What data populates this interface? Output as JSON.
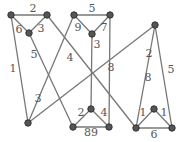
{
  "graph": {
    "nodes": [
      {
        "id": "A",
        "x": 11,
        "y": 15
      },
      {
        "id": "B",
        "x": 47,
        "y": 15
      },
      {
        "id": "C",
        "x": 29,
        "y": 33
      },
      {
        "id": "D",
        "x": 74,
        "y": 15
      },
      {
        "id": "E",
        "x": 110,
        "y": 15
      },
      {
        "id": "F",
        "x": 92,
        "y": 34
      },
      {
        "id": "G",
        "x": 155,
        "y": 25
      },
      {
        "id": "H",
        "x": 28,
        "y": 123
      },
      {
        "id": "I",
        "x": 73,
        "y": 127
      },
      {
        "id": "J",
        "x": 91,
        "y": 109
      },
      {
        "id": "K",
        "x": 109,
        "y": 127
      },
      {
        "id": "L",
        "x": 136,
        "y": 128
      },
      {
        "id": "M",
        "x": 154,
        "y": 109
      },
      {
        "id": "N",
        "x": 172,
        "y": 128
      }
    ],
    "edges": [
      {
        "from": "A",
        "to": "B",
        "label": "2",
        "lx": 33,
        "ly": 12
      },
      {
        "from": "A",
        "to": "C",
        "label": "6",
        "lx": 19,
        "ly": 33
      },
      {
        "from": "B",
        "to": "C",
        "label": "3",
        "lx": 41,
        "ly": 32
      },
      {
        "from": "A",
        "to": "H",
        "label": "1",
        "lx": 13,
        "ly": 72
      },
      {
        "from": "C",
        "to": "I",
        "label": "5",
        "lx": 34,
        "ly": 58
      },
      {
        "from": "D",
        "to": "H",
        "label": "3",
        "lx": 38,
        "ly": 102
      },
      {
        "from": "B",
        "to": "L",
        "label": "4",
        "lx": 70,
        "ly": 61
      },
      {
        "from": "D",
        "to": "E",
        "label": "5",
        "lx": 92,
        "ly": 12
      },
      {
        "from": "D",
        "to": "F",
        "label": "9",
        "lx": 78,
        "ly": 31
      },
      {
        "from": "E",
        "to": "F",
        "label": "7",
        "lx": 104,
        "ly": 31
      },
      {
        "from": "F",
        "to": "J",
        "label": "3",
        "lx": 97,
        "ly": 48
      },
      {
        "from": "G",
        "to": "H",
        "label": "8",
        "lx": 111,
        "ly": 71
      },
      {
        "from": "E",
        "to": "K",
        "label": "8",
        "lx": 148,
        "ly": 81
      },
      {
        "from": "G",
        "to": "L",
        "label": "2",
        "lx": 149,
        "ly": 57
      },
      {
        "from": "G",
        "to": "N",
        "label": "5",
        "lx": 171,
        "ly": 73
      },
      {
        "from": "J",
        "to": "I",
        "label": "2",
        "lx": 81,
        "ly": 116
      },
      {
        "from": "J",
        "to": "K",
        "label": "4",
        "lx": 104,
        "ly": 116
      },
      {
        "from": "I",
        "to": "K",
        "label": "89",
        "lx": 91,
        "ly": 136
      },
      {
        "from": "M",
        "to": "L",
        "label": "1",
        "lx": 143,
        "ly": 116
      },
      {
        "from": "M",
        "to": "N",
        "label": "1",
        "lx": 164,
        "ly": 116
      },
      {
        "from": "L",
        "to": "N",
        "label": "6",
        "lx": 154,
        "ly": 138
      }
    ]
  }
}
